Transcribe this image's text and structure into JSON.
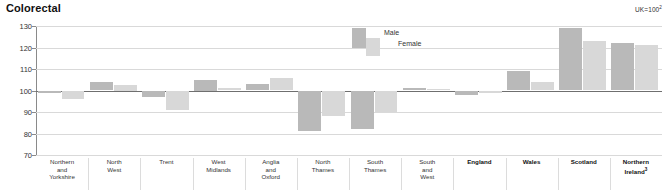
{
  "title": "Colorectal",
  "index_note": {
    "text": "UK=100",
    "superscript": "2"
  },
  "legend": {
    "male": "Male",
    "female": "Female"
  },
  "chart_data": {
    "type": "bar",
    "title": "Colorectal",
    "xlabel": "",
    "ylabel": "",
    "ylim": [
      70,
      130
    ],
    "yticks": [
      70,
      80,
      90,
      100,
      110,
      120,
      130
    ],
    "baseline": 100,
    "grid": true,
    "legend_position": "top-center",
    "annotations": [
      "UK=100"
    ],
    "categories": [
      "Northern and Yorkshire",
      "North West",
      "Trent",
      "West Midlands",
      "Anglia and Oxford",
      "North Thames",
      "South Thames",
      "South and West",
      "England",
      "Wales",
      "Scotland",
      "Northern Ireland"
    ],
    "category_lines": [
      [
        "Northern",
        "and",
        "Yorkshire"
      ],
      [
        "North",
        "West"
      ],
      [
        "Trent"
      ],
      [
        "West",
        "Midlands"
      ],
      [
        "Anglia",
        "and",
        "Oxford"
      ],
      [
        "North",
        "Thames"
      ],
      [
        "South",
        "Thames"
      ],
      [
        "South",
        "and",
        "West"
      ],
      [
        "England"
      ],
      [
        "Wales"
      ],
      [
        "Scotland"
      ],
      [
        "Northern",
        "Ireland"
      ]
    ],
    "category_bold": [
      false,
      false,
      false,
      false,
      false,
      false,
      false,
      false,
      true,
      true,
      true,
      true
    ],
    "category_superscript": [
      "",
      "",
      "",
      "",
      "",
      "",
      "",
      "",
      "",
      "",
      "",
      "3"
    ],
    "series": [
      {
        "name": "Male",
        "color": "#b9b9b9",
        "values": [
          99,
          104,
          97,
          105,
          103,
          81,
          82,
          101,
          98,
          109,
          129,
          122
        ]
      },
      {
        "name": "Female",
        "color": "#d8d8d8",
        "values": [
          96,
          102.5,
          91,
          101,
          106,
          88,
          90,
          100.5,
          99,
          104,
          123,
          121
        ]
      }
    ]
  }
}
